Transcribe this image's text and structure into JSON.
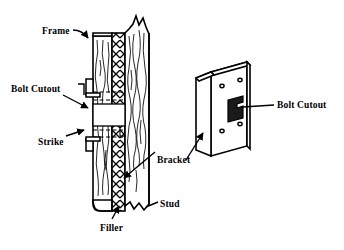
{
  "figure": {
    "stroke_color": "#000000",
    "fill_color": "#ffffff",
    "background_color": "#ffffff"
  },
  "labels": [
    {
      "id": "frame",
      "text": "Frame",
      "x": 42,
      "y": 27
    },
    {
      "id": "bolt-cutout-left",
      "text": "Bolt Cutout",
      "x": 11,
      "y": 85
    },
    {
      "id": "strike",
      "text": "Strike",
      "x": 38,
      "y": 138
    },
    {
      "id": "bracket",
      "text": "Bracket",
      "x": 157,
      "y": 156
    },
    {
      "id": "stud",
      "text": "Stud",
      "x": 160,
      "y": 200
    },
    {
      "id": "filler",
      "text": "Filler",
      "x": 100,
      "y": 224
    },
    {
      "id": "bolt-cutout-right",
      "text": "Bolt Cutout",
      "x": 277,
      "y": 101
    }
  ],
  "left_assembly": {
    "name": "door-frame-cross-section",
    "description": "Vertical cut-away section through door frame, filler, bracket and stud",
    "parts": [
      {
        "id": "frame",
        "label": "Frame",
        "hatch": "wood-grain"
      },
      {
        "id": "filler",
        "label": "Filler",
        "hatch": "wood-grain"
      },
      {
        "id": "bracket",
        "label": "Bracket",
        "hatch": "herringbone"
      },
      {
        "id": "stud",
        "label": "Stud",
        "hatch": "wood-grain"
      },
      {
        "id": "strike",
        "label": "Strike",
        "hatch": "solid"
      }
    ],
    "bolt_cutout_present": true
  },
  "right_assembly": {
    "name": "bracket-isometric",
    "description": "Isometric view of the L-shaped mounting bracket plate",
    "screw_hole_count": 4,
    "bolt_cutout_present": true
  }
}
